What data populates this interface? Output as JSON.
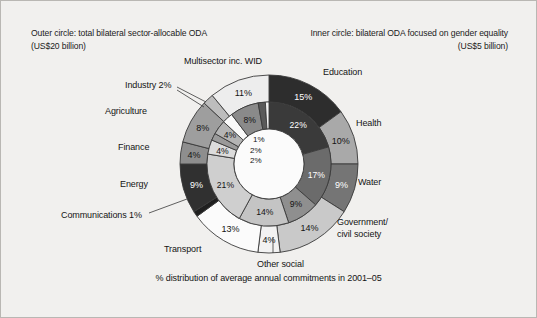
{
  "header": {
    "outer_line1": "Outer circle: total bilateral sector-allocable ODA",
    "outer_line2": "(US$20 billion)",
    "inner_line1": "Inner circle: bilateral ODA focused on gender equality",
    "inner_line2": "(US$5 billion)"
  },
  "footer": {
    "caption": "% distribution of average annual commitments in 2001–05"
  },
  "labels": {
    "education": "Education",
    "health": "Health",
    "water": "Water",
    "government_l1": "Government/",
    "government_l2": "civil society",
    "other_social": "Other social",
    "transport": "Transport",
    "communications": "Communications 1%",
    "energy": "Energy",
    "finance": "Finance",
    "agriculture": "Agriculture",
    "industry": "Industry 2%",
    "multisector": "Multisector inc. WID"
  },
  "chart_data": {
    "type": "pie",
    "title": "% distribution of average annual commitments in 2001–05",
    "subtitle": "Outer circle: total bilateral sector-allocable ODA (US$20 billion) / Inner circle: bilateral ODA focused on gender equality (US$5 billion)",
    "variant": "nested-donut",
    "start_angle_deg": 0,
    "direction": "clockwise",
    "legend": "outside-labels",
    "grid": false,
    "series": [
      {
        "name": "Outer circle: total bilateral sector-allocable ODA (US$20 billion)",
        "ring": "outer",
        "total_label": "US$20 billion",
        "categories": [
          "Education",
          "Health",
          "Water",
          "Government/civil society",
          "Other social",
          "Transport",
          "Communications",
          "Energy",
          "Finance",
          "Agriculture",
          "Industry",
          "Multisector inc. WID"
        ],
        "values": [
          15,
          10,
          9,
          14,
          4,
          13,
          1,
          9,
          4,
          8,
          2,
          11
        ],
        "value_labels": [
          "15%",
          "10%",
          "9%",
          "14%",
          "4%",
          "13%",
          "1%",
          "9%",
          "4%",
          "8%",
          "2%",
          "11%"
        ],
        "colors": [
          "#2d2d2d",
          "#a9a9a9",
          "#757575",
          "#c9c9c9",
          "#f2f2f2",
          "#fbfbfb",
          "#1f1f1f",
          "#303030",
          "#8e8e8e",
          "#9e9e9e",
          "#bdbdbd",
          "#ededed"
        ]
      },
      {
        "name": "Inner circle: bilateral ODA focused on gender equality (US$5 billion)",
        "ring": "inner",
        "total_label": "US$5 billion",
        "categories": [
          "Education",
          "Health",
          "Water",
          "Government/civil society",
          "Other social",
          "Transport",
          "Communications",
          "Energy",
          "Finance",
          "Agriculture",
          "Industry",
          "Multisector inc. WID"
        ],
        "values": [
          22,
          17,
          9,
          14,
          21,
          4,
          2,
          4,
          3,
          8,
          2,
          1
        ],
        "value_labels": [
          "22%",
          "17%",
          "9%",
          "14%",
          "21%",
          "4%",
          "2%",
          "4%",
          "3%",
          "8%",
          "2%",
          "1%"
        ],
        "colors": [
          "#3a3a3a",
          "#6b6b6b",
          "#8f8f8f",
          "#c4c4c4",
          "#cfcfcf",
          "#dcdcdc",
          "#9a9a9a",
          "#b4b4b4",
          "#fafafa",
          "#8a8a8a",
          "#5a5a5a",
          "#f4f4f4"
        ]
      }
    ]
  },
  "style": {
    "background": "#f1f0ee",
    "border": "#b9b7b3",
    "text": "#141414",
    "stroke": "#3a3a3a"
  }
}
